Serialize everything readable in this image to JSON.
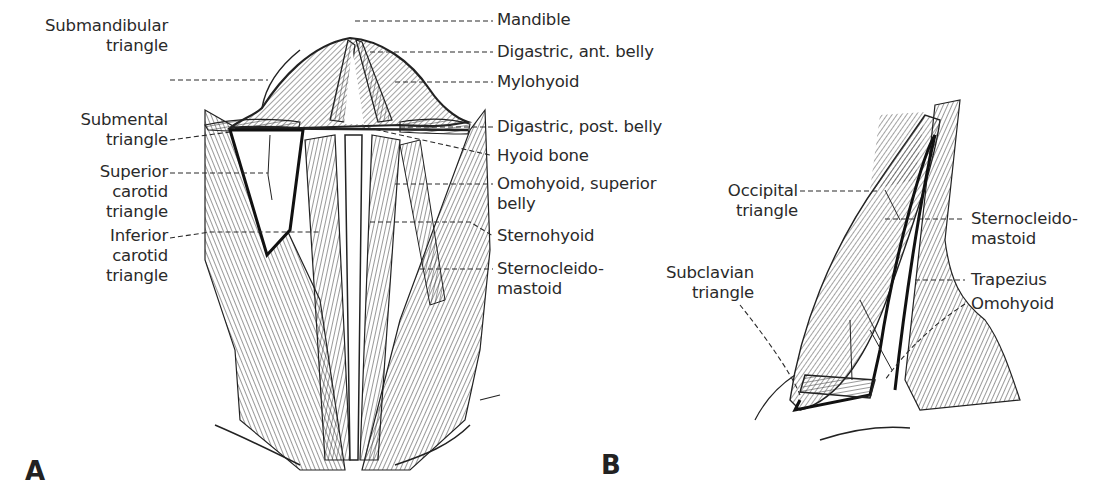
{
  "figure": {
    "panels": [
      {
        "id": "A",
        "label": "A"
      },
      {
        "id": "B",
        "label": "B"
      }
    ],
    "panel_a": {
      "labels_left": [
        {
          "key": "submandibular",
          "lines": [
            "Submandibular",
            "triangle"
          ]
        },
        {
          "key": "submental",
          "lines": [
            "Submental",
            "triangle"
          ]
        },
        {
          "key": "superior_carotid",
          "lines": [
            "Superior",
            "carotid",
            "triangle"
          ]
        },
        {
          "key": "inferior_carotid",
          "lines": [
            "Inferior",
            "carotid",
            "triangle"
          ]
        }
      ],
      "labels_right": [
        {
          "key": "mandible",
          "lines": [
            "Mandible"
          ]
        },
        {
          "key": "digastric_ant",
          "lines": [
            "Digastric, ant. belly"
          ]
        },
        {
          "key": "mylohyoid",
          "lines": [
            "Mylohyoid"
          ]
        },
        {
          "key": "digastric_post",
          "lines": [
            "Digastric, post. belly"
          ]
        },
        {
          "key": "hyoid",
          "lines": [
            "Hyoid bone"
          ]
        },
        {
          "key": "omohyoid_sup",
          "lines": [
            "Omohyoid, superior",
            "belly"
          ]
        },
        {
          "key": "sternohyoid",
          "lines": [
            "Sternohyoid"
          ]
        },
        {
          "key": "scm",
          "lines": [
            "Sternocleido-",
            "mastoid"
          ]
        }
      ]
    },
    "panel_b": {
      "labels_left": [
        {
          "key": "occipital",
          "lines": [
            "Occipital",
            "triangle"
          ]
        },
        {
          "key": "subclavian",
          "lines": [
            "Subclavian",
            "triangle"
          ]
        }
      ],
      "labels_right": [
        {
          "key": "scm",
          "lines": [
            "Sternocleido-",
            "mastoid"
          ]
        },
        {
          "key": "trapezius",
          "lines": [
            "Trapezius"
          ]
        },
        {
          "key": "omohyoid",
          "lines": [
            "Omohyoid"
          ]
        }
      ]
    },
    "colors": {
      "ink": "#2a2a2a",
      "background": "#ffffff"
    }
  }
}
